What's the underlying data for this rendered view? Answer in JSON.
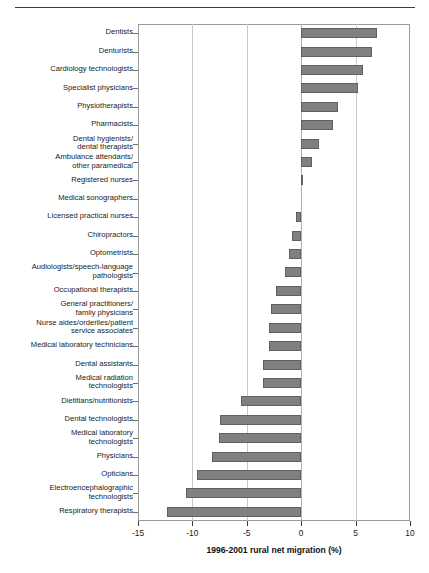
{
  "chart_data": {
    "type": "bar",
    "orientation": "horizontal",
    "title": "",
    "xlabel": "1996-2001 rural net migration (%)",
    "ylabel": "",
    "xlim": [
      -15,
      10
    ],
    "xticks": [
      -15,
      -10,
      -5,
      0,
      5,
      10
    ],
    "xtick_labels": [
      "-15",
      "-10",
      "-5",
      "0",
      "5",
      "10"
    ],
    "grid": true,
    "grid_axis": "x",
    "legend": null,
    "bar_color": "#808080",
    "bar_edge_color": "#606060",
    "categories": [
      "Dentists",
      "Denturists",
      "Cardiology technologists",
      "Specialist physicians",
      "Physiotherapists",
      "Pharmacists",
      "Dental hygienists/\ndental therapists",
      "Ambulance attendants/\nother paramedical",
      "Registered nurses",
      "Medical sonographers",
      "Licensed practical nurses",
      "Chiropractors",
      "Optometrists",
      "Audiologists/speech-language\npathologists",
      "Occupational therapists",
      "General practitioners/\nfamily physicians",
      "Nurse aides/orderlies/patient\nservice associates",
      "Medical laboratory technicians",
      "Dental assistants",
      "Medical radiation\ntechnologists",
      "Dietitians/nutritionists",
      "Dental technologists",
      "Medical laboratory\ntechnologists",
      "Physicians",
      "Opticians",
      "Electroencephalographic\ntechnologists",
      "Respiratory therapists"
    ],
    "values": [
      7.0,
      6.5,
      5.7,
      5.2,
      3.4,
      2.9,
      1.6,
      1.0,
      0.2,
      0.0,
      -0.5,
      -0.8,
      -1.1,
      -1.5,
      -2.3,
      -2.8,
      -3.0,
      -3.0,
      -3.5,
      -3.5,
      -5.5,
      -7.5,
      -7.6,
      -8.2,
      -9.6,
      -10.6,
      -12.3
    ]
  }
}
